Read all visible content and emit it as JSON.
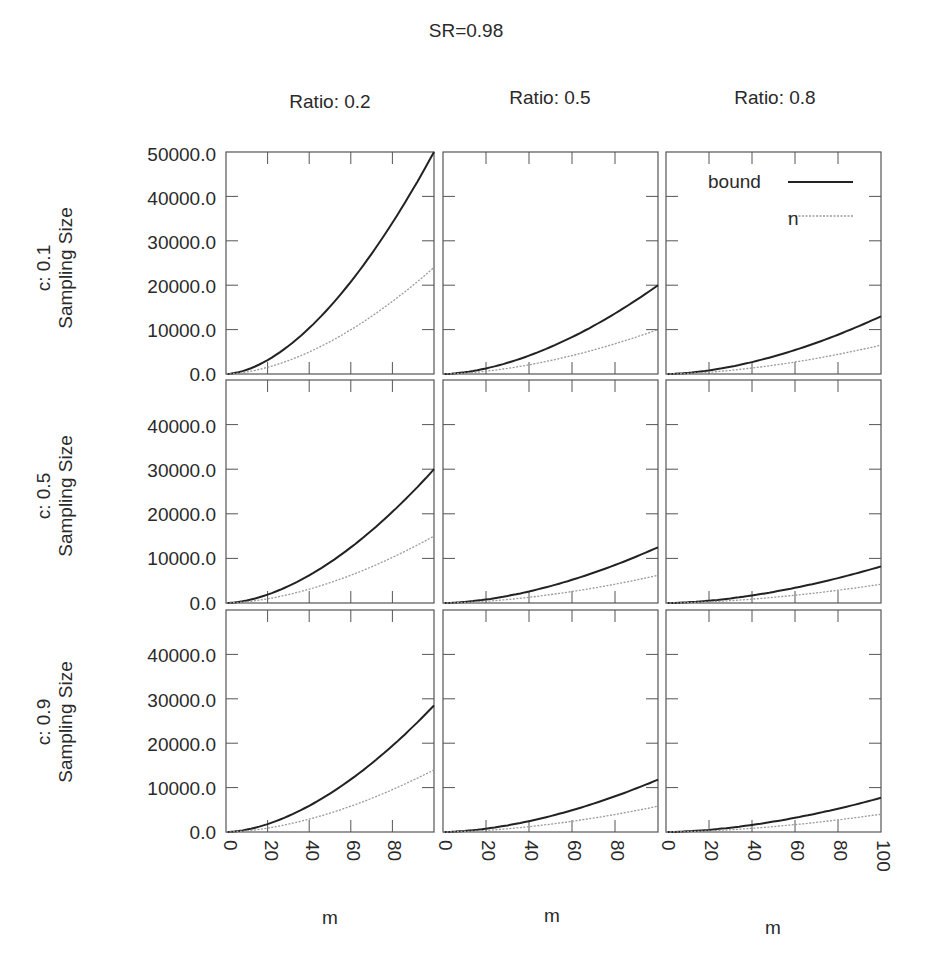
{
  "title": "SR=0.98",
  "columns": [
    {
      "label": "Ratio: 0.2"
    },
    {
      "label": "Ratio: 0.5"
    },
    {
      "label": "Ratio: 0.8"
    }
  ],
  "rows": [
    {
      "label": "c: 0.1",
      "ylabel": "Sampling Size"
    },
    {
      "label": "c: 0.5",
      "ylabel": "Sampling Size"
    },
    {
      "label": "c: 0.9",
      "ylabel": "Sampling Size"
    }
  ],
  "legend": {
    "items": [
      {
        "label": "bound",
        "style": "solid"
      },
      {
        "label": "n",
        "style": "dotted"
      }
    ]
  },
  "xlabel": "m",
  "yticks_row1": [
    "50000.0",
    "40000.0",
    "30000.0",
    "20000.0",
    "10000.0",
    "0.0"
  ],
  "yticks_other": [
    "40000.0",
    "30000.0",
    "20000.0",
    "10000.0",
    "0.0"
  ],
  "xticks_col12": [
    "0",
    "20",
    "40",
    "60",
    "80"
  ],
  "xticks_col3": [
    "0",
    "20",
    "40",
    "60",
    "80",
    "100"
  ],
  "colors": {
    "bound": "#222222",
    "n": "#9a9a9a",
    "frame": "#555555"
  },
  "chart_data": {
    "type": "line",
    "title": "SR=0.98",
    "layout": "3x3 facet grid (rows: c, columns: Ratio)",
    "xlabel": "m",
    "ylabel": "Sampling Size",
    "xlim": [
      0,
      100
    ],
    "ylim": [
      0,
      50000
    ],
    "x": [
      0,
      20,
      40,
      60,
      80,
      100
    ],
    "legend_position": "top-right panel, upper right",
    "grid": false,
    "panels": [
      {
        "row": "c: 0.1",
        "col": "Ratio: 0.2",
        "series": [
          {
            "name": "bound",
            "values": [
              0,
              3300,
              10800,
              21500,
              34800,
              50000
            ]
          },
          {
            "name": "n",
            "values": [
              0,
              1600,
              5200,
              10300,
              16700,
              24000
            ]
          }
        ]
      },
      {
        "row": "c: 0.1",
        "col": "Ratio: 0.5",
        "series": [
          {
            "name": "bound",
            "values": [
              0,
              1300,
              4300,
              8600,
              13900,
              20000
            ]
          },
          {
            "name": "n",
            "values": [
              0,
              650,
              2150,
              4300,
              6950,
              10000
            ]
          }
        ]
      },
      {
        "row": "c: 0.1",
        "col": "Ratio: 0.8",
        "series": [
          {
            "name": "bound",
            "values": [
              0,
              850,
              2800,
              5600,
              9000,
              13000
            ]
          },
          {
            "name": "n",
            "values": [
              0,
              430,
              1400,
              2800,
              4500,
              6500
            ]
          }
        ]
      },
      {
        "row": "c: 0.5",
        "col": "Ratio: 0.2",
        "series": [
          {
            "name": "bound",
            "values": [
              0,
              2000,
              6500,
              12900,
              20900,
              30000
            ]
          },
          {
            "name": "n",
            "values": [
              0,
              1000,
              3200,
              6450,
              10400,
              15000
            ]
          }
        ]
      },
      {
        "row": "c: 0.5",
        "col": "Ratio: 0.5",
        "series": [
          {
            "name": "bound",
            "values": [
              0,
              820,
              2700,
              5400,
              8700,
              12500
            ]
          },
          {
            "name": "n",
            "values": [
              0,
              410,
              1330,
              2670,
              4300,
              6200
            ]
          }
        ]
      },
      {
        "row": "c: 0.5",
        "col": "Ratio: 0.8",
        "series": [
          {
            "name": "bound",
            "values": [
              0,
              540,
              1760,
              3530,
              5700,
              8200
            ]
          },
          {
            "name": "n",
            "values": [
              0,
              280,
              900,
              1800,
              2900,
              4200
            ]
          }
        ]
      },
      {
        "row": "c: 0.9",
        "col": "Ratio: 0.2",
        "series": [
          {
            "name": "bound",
            "values": [
              0,
              1900,
              6100,
              12300,
              19800,
              28500
            ]
          },
          {
            "name": "n",
            "values": [
              0,
              920,
              3000,
              6000,
              9700,
              14000
            ]
          }
        ]
      },
      {
        "row": "c: 0.9",
        "col": "Ratio: 0.5",
        "series": [
          {
            "name": "bound",
            "values": [
              0,
              780,
              2540,
              5070,
              8200,
              11800
            ]
          },
          {
            "name": "n",
            "values": [
              0,
              380,
              1250,
              2500,
              4000,
              5800
            ]
          }
        ]
      },
      {
        "row": "c: 0.9",
        "col": "Ratio: 0.8",
        "series": [
          {
            "name": "bound",
            "values": [
              0,
              510,
              1660,
              3310,
              5350,
              7700
            ]
          },
          {
            "name": "n",
            "values": [
              0,
              260,
              860,
              1720,
              2780,
              4000
            ]
          }
        ]
      }
    ]
  }
}
